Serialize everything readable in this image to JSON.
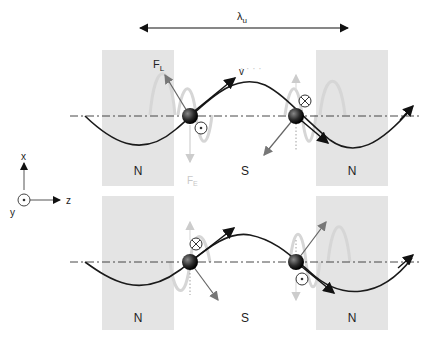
{
  "diagram": {
    "wavelength_label": "λ",
    "wavelength_sub": "u",
    "axes": {
      "x": "x",
      "y": "y",
      "z": "z"
    },
    "top_panel": {
      "left_region": "N",
      "middle_region": "S",
      "right_region": "N",
      "force_lorentz": "F",
      "force_lorentz_sub": "L",
      "force_electric": "F",
      "force_electric_sub": "E",
      "velocity": "v",
      "left_field_symbol": "out-of-page (⊙)",
      "right_field_symbol": "into-page (⊗)"
    },
    "bottom_panel": {
      "left_region": "N",
      "middle_region": "S",
      "right_region": "N",
      "left_field_symbol": "into-page (⊗)",
      "right_field_symbol": "out-of-page (⊙)"
    },
    "colors": {
      "magnet_block": "#e2e2e2",
      "trajectory": "#1a1a1a",
      "faint_wave": "#d4d4d4",
      "axis_line": "#333333",
      "arrow_gray": "#777777"
    }
  }
}
